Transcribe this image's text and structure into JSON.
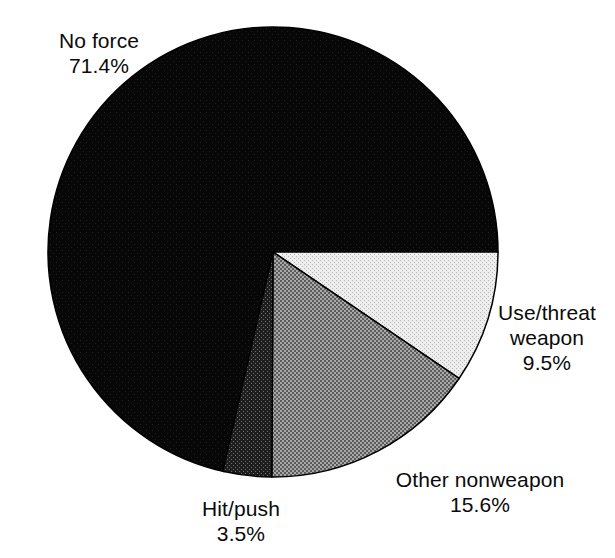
{
  "chart_data": {
    "type": "pie",
    "title": "",
    "subtitle": "",
    "xlabel": "",
    "ylabel": "",
    "legend_position": "none",
    "grid": false,
    "labels_show_percent": true,
    "categories": [
      "No force",
      "Use/threat weapon",
      "Other nonweapon",
      "Hit/push"
    ],
    "values": [
      71.4,
      9.5,
      15.6,
      3.5
    ],
    "units": "percent",
    "start_angle_deg": 90,
    "direction": "clockwise",
    "center": {
      "x": 273,
      "y": 252
    },
    "radius": 225,
    "slices": [
      {
        "name": "no-force",
        "label": "No force",
        "value": 71.4,
        "value_text": "71.4%",
        "fill": "#0b0b0b",
        "pattern": "solid-black",
        "start_deg": 192.6,
        "end_deg": 450.0
      },
      {
        "name": "use-threat-weapon",
        "label": "Use/threat",
        "label_line2": "weapon",
        "value": 9.5,
        "value_text": "9.5%",
        "fill": "#dedede",
        "pattern": "light-dither",
        "start_deg": 90.0,
        "end_deg": 124.2
      },
      {
        "name": "other-nonweapon",
        "label": "Other nonweapon",
        "value": 15.6,
        "value_text": "15.6%",
        "fill": "#808080",
        "pattern": "checker-dither",
        "start_deg": 124.2,
        "end_deg": 180.3
      },
      {
        "name": "hit-push",
        "label": "Hit/push",
        "value": 3.5,
        "value_text": "3.5%",
        "fill": "#3a3a3a",
        "pattern": "dark-dither",
        "start_deg": 180.3,
        "end_deg": 192.9
      }
    ],
    "outline_color": "#000000",
    "background": "#ffffff"
  },
  "labels": {
    "no_force": {
      "name": "No force",
      "percent": "71.4%"
    },
    "use_threat_weapon": {
      "line1": "Use/threat",
      "line2": "weapon",
      "percent": "9.5%"
    },
    "other_nonweapon": {
      "name": "Other nonweapon",
      "percent": "15.6%"
    },
    "hit_push": {
      "name": "Hit/push",
      "percent": "3.5%"
    }
  }
}
